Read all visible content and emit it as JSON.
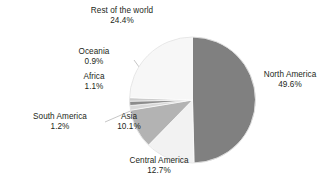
{
  "chart_data": {
    "type": "pie",
    "title": "",
    "subtitle": "",
    "xlabel": "",
    "ylabel": "",
    "legend_position": "none",
    "grid": false,
    "units": "percent",
    "total": 100.0,
    "categories": [
      "North America",
      "Central America",
      "Asia",
      "South America",
      "Africa",
      "Oceania",
      "Rest of the world"
    ],
    "values": [
      49.6,
      12.7,
      10.1,
      1.2,
      1.1,
      0.9,
      24.4
    ],
    "slices": [
      {
        "label": "North America",
        "value": 49.6,
        "value_text": "49.6%",
        "color": "#808080",
        "start_deg": 0.0,
        "end_deg": 178.56,
        "label_side": "right",
        "leader": false
      },
      {
        "label": "Central America",
        "value": 12.7,
        "value_text": "12.7%",
        "color": "#f2f2f2",
        "start_deg": 178.56,
        "end_deg": 224.28,
        "label_side": "bottom",
        "leader": false
      },
      {
        "label": "Asia",
        "value": 10.1,
        "value_text": "10.1%",
        "color": "#b3b3b3",
        "start_deg": 224.28,
        "end_deg": 260.64,
        "label_side": "left",
        "leader": false
      },
      {
        "label": "South America",
        "value": 1.2,
        "value_text": "1.2%",
        "color": "#d9d9d9",
        "start_deg": 260.64,
        "end_deg": 264.96,
        "label_side": "left",
        "leader": true
      },
      {
        "label": "Africa",
        "value": 1.1,
        "value_text": "1.1%",
        "color": "#8c8c8c",
        "start_deg": 264.96,
        "end_deg": 268.92,
        "label_side": "left",
        "leader": true
      },
      {
        "label": "Oceania",
        "value": 0.9,
        "value_text": "0.9%",
        "color": "#cccccc",
        "start_deg": 268.92,
        "end_deg": 272.16,
        "label_side": "left",
        "leader": true
      },
      {
        "label": "Rest of the world",
        "value": 24.4,
        "value_text": "24.4%",
        "color": "#f7f7f7",
        "start_deg": 272.16,
        "end_deg": 360.0,
        "label_side": "top",
        "leader": false
      }
    ]
  },
  "labels": {
    "north_america": {
      "name": "North America",
      "percent": "49.6%"
    },
    "central_america": {
      "name": "Central America",
      "percent": "12.7%"
    },
    "asia": {
      "name": "Asia",
      "percent": "10.1%"
    },
    "south_america": {
      "name": "South America",
      "percent": "1.2%"
    },
    "africa": {
      "name": "Africa",
      "percent": "1.1%"
    },
    "oceania": {
      "name": "Oceania",
      "percent": "0.9%"
    },
    "rest_of_world": {
      "name": "Rest of the world",
      "percent": "24.4%"
    }
  },
  "style": {
    "background": "#ffffff",
    "text_color": "#231f20",
    "leader_line_color": "#b0b0b0",
    "slice_edge_color": "#ffffff"
  }
}
